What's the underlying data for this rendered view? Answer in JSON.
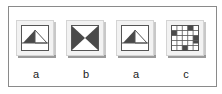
{
  "figure": {
    "border_color": "#8a8a8a",
    "items": [
      {
        "label": "a",
        "icon": "triangle-mountain-icon"
      },
      {
        "label": "b",
        "icon": "hourglass-bowtie-icon"
      },
      {
        "label": "a",
        "icon": "triangle-mountain-icon"
      },
      {
        "label": "c",
        "icon": "checker-grid-icon"
      }
    ],
    "dark_color": "#4a4a4a"
  }
}
